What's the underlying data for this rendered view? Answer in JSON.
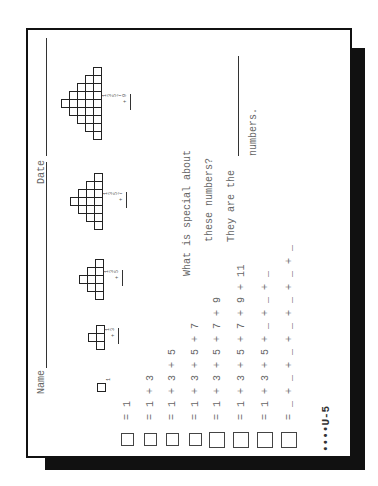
{
  "worksheet": {
    "header": {
      "name_label": "Name",
      "date_label": "Date"
    },
    "pyramids": [
      {
        "rows": [
          1
        ],
        "labels": [
          "1"
        ],
        "operator": ""
      },
      {
        "rows": [
          1,
          3
        ],
        "labels": [
          "1",
          "3"
        ],
        "operator": "+"
      },
      {
        "rows": [
          1,
          3,
          5
        ],
        "labels": [
          "1",
          "3",
          "5"
        ],
        "operator": "+"
      },
      {
        "rows": [
          1,
          3,
          5,
          7
        ],
        "labels": [
          "1",
          "3",
          "5",
          "7"
        ],
        "operator": "+"
      },
      {
        "rows": [
          1,
          3,
          5,
          7,
          9
        ],
        "labels": [
          "1",
          "3",
          "5",
          "7",
          "9"
        ],
        "operator": "+"
      }
    ],
    "equations": [
      {
        "equals": "=",
        "expression": "1"
      },
      {
        "equals": "=",
        "expression": "1 + 3"
      },
      {
        "equals": "=",
        "expression": "1 + 3 + 5"
      },
      {
        "equals": "=",
        "expression": "1 + 3 + 5 + 7"
      },
      {
        "equals": "=",
        "expression": "1 + 3 + 5 + 7 + 9"
      },
      {
        "equals": "=",
        "expression": "1 + 3 + 5 + 7 + 9 + 11"
      },
      {
        "equals": "=",
        "expression": "1 + 3 + 5 + _ + _ + _"
      },
      {
        "equals": "=",
        "expression": "_ + _ + _ + _ + _ + _ + _"
      }
    ],
    "questions": {
      "line1": "What is special about",
      "line2": "these numbers?",
      "line3": "They are the",
      "line4": "numbers."
    },
    "page_code": "••••U-5"
  }
}
